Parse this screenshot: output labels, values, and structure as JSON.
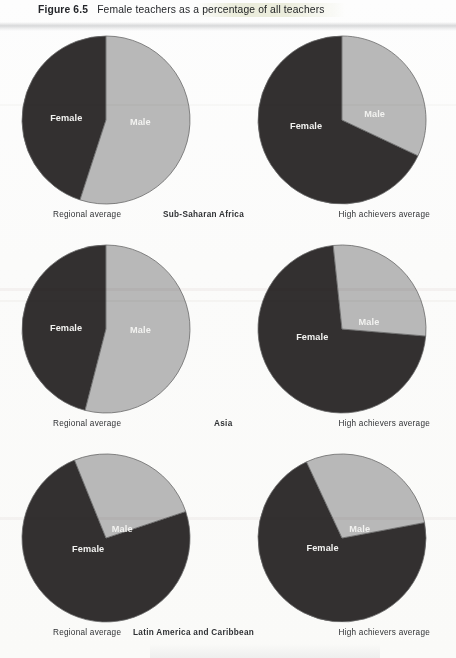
{
  "figure": {
    "label": "Figure 6.5",
    "caption": "Female teachers as a percentage of all teachers"
  },
  "labels": {
    "female": "Female",
    "male": "Male",
    "regional_average": "Regional average",
    "high_achievers_average": "High achievers average"
  },
  "colors": {
    "female_slice": "#333030",
    "male_slice": "#b8b8b8",
    "slice_outline": "#6a6a6a",
    "page_background": "#fbfbfa",
    "text": "#2f3134"
  },
  "rows": [
    {
      "region": "Sub-Saharan Africa",
      "left_caption": "Regional average",
      "right_caption": "High achievers average"
    },
    {
      "region": "Asia",
      "left_caption": "Regional average",
      "right_caption": "High achievers average"
    },
    {
      "region": "Latin America and Caribbean",
      "left_caption": "Regional average",
      "right_caption": "High achievers average"
    }
  ],
  "chart_data": [
    {
      "type": "pie",
      "title": "Sub-Saharan Africa — Regional average",
      "labels": [
        "Female",
        "Male"
      ],
      "values": [
        45,
        55
      ],
      "start_angle_deg": 0,
      "direction": "counterclockwise",
      "colors": [
        "#333030",
        "#b8b8b8"
      ]
    },
    {
      "type": "pie",
      "title": "Sub-Saharan Africa — High achievers average",
      "labels": [
        "Female",
        "Male"
      ],
      "values": [
        68,
        32
      ],
      "start_angle_deg": 0,
      "direction": "counterclockwise",
      "colors": [
        "#333030",
        "#b8b8b8"
      ]
    },
    {
      "type": "pie",
      "title": "Asia — Regional average",
      "labels": [
        "Female",
        "Male"
      ],
      "values": [
        46,
        54
      ],
      "start_angle_deg": 0,
      "direction": "counterclockwise",
      "colors": [
        "#333030",
        "#b8b8b8"
      ]
    },
    {
      "type": "pie",
      "title": "Asia — High achievers average",
      "labels": [
        "Female",
        "Male"
      ],
      "values": [
        72,
        28
      ],
      "start_angle_deg": -6,
      "direction": "counterclockwise",
      "colors": [
        "#333030",
        "#b8b8b8"
      ]
    },
    {
      "type": "pie",
      "title": "Latin America and Caribbean — Regional average",
      "labels": [
        "Female",
        "Male"
      ],
      "values": [
        74,
        26
      ],
      "start_angle_deg": -22,
      "direction": "counterclockwise",
      "colors": [
        "#333030",
        "#b8b8b8"
      ]
    },
    {
      "type": "pie",
      "title": "Latin America and Caribbean — High achievers average",
      "labels": [
        "Female",
        "Male"
      ],
      "values": [
        71,
        29
      ],
      "start_angle_deg": -25,
      "direction": "counterclockwise",
      "colors": [
        "#333030",
        "#b8b8b8"
      ]
    }
  ]
}
